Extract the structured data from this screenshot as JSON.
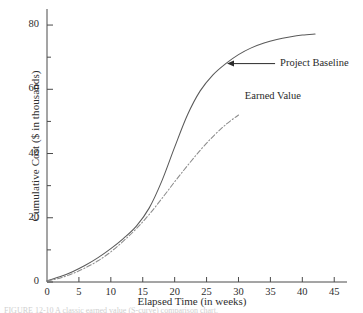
{
  "figure": {
    "caption": "FIGURE 12-10   A classic earned value (S-curve) comparison chart.",
    "background": "#ffffff",
    "ink_color": "#4a4a4a"
  },
  "chart_data": {
    "type": "line",
    "title": "",
    "subtitle": "",
    "xlabel": "Elapsed Time (in weeks)",
    "ylabel": "Cumulative Cost ($ in thousands)",
    "xlim": [
      0,
      47
    ],
    "ylim": [
      0,
      85
    ],
    "xticks": [
      0,
      5,
      10,
      15,
      20,
      25,
      30,
      35,
      40,
      45
    ],
    "xtick_labels": [
      "0",
      "5",
      "10",
      "15",
      "20",
      "25",
      "30",
      "35",
      "40",
      "45"
    ],
    "yticks": [
      0,
      20,
      40,
      60,
      80
    ],
    "ytick_labels": [
      "0",
      "20",
      "40",
      "60",
      "80"
    ],
    "yminorticks": [
      10,
      30,
      50,
      70
    ],
    "grid": false,
    "legend": "annotations",
    "spines": [
      "left",
      "bottom"
    ],
    "series": [
      {
        "name": "Project Baseline",
        "style": "solid",
        "color": "#5a5a5a",
        "x": [
          0,
          2,
          4,
          6,
          8,
          10,
          12,
          14,
          16,
          18,
          20,
          22,
          24,
          26,
          28,
          30,
          32,
          34,
          36,
          38,
          40,
          42
        ],
        "values": [
          0.4,
          1.6,
          3.2,
          5.2,
          7.6,
          10.4,
          13.6,
          17.4,
          23.0,
          31.5,
          42.0,
          52.0,
          59.5,
          64.5,
          68.0,
          70.8,
          72.9,
          74.4,
          75.5,
          76.3,
          76.9,
          77.2
        ]
      },
      {
        "name": "Earned Value",
        "style": "dashdot",
        "color": "#8c8c8c",
        "x": [
          0,
          2,
          4,
          6,
          8,
          10,
          12,
          14,
          16,
          18,
          20,
          22,
          24,
          26,
          28,
          30
        ],
        "values": [
          0.3,
          1.2,
          2.6,
          4.4,
          6.6,
          9.4,
          12.8,
          16.6,
          21.0,
          26.0,
          31.2,
          36.2,
          41.0,
          45.3,
          49.0,
          52.0
        ]
      }
    ],
    "annotations": [
      {
        "label": "Project Baseline",
        "arrow": true,
        "arrow_direction": "left",
        "points_to_x": 28.2,
        "points_to_y": 68.0,
        "label_x": 36.2,
        "label_y": 68.0
      },
      {
        "label": "Earned Value",
        "arrow": false,
        "points_to_x": 30.0,
        "points_to_y": 52.0,
        "label_x": 31.0,
        "label_y": 57.5
      }
    ]
  }
}
